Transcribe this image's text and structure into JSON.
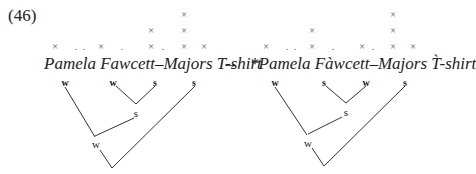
{
  "example": {
    "number": "(46)",
    "arrow": "→",
    "mark": "×",
    "dot": ".",
    "left": {
      "phrase": "Pamela Fawcett–Majors T-shirt",
      "grid_columns": [
        {
          "x": 55,
          "rows": [
            "×"
          ]
        },
        {
          "x": 76,
          "rows": [
            "."
          ]
        },
        {
          "x": 84,
          "rows": [
            "."
          ]
        },
        {
          "x": 101,
          "rows": [
            "×"
          ]
        },
        {
          "x": 122,
          "rows": [
            "."
          ]
        },
        {
          "x": 151,
          "rows": [
            "×",
            "×"
          ]
        },
        {
          "x": 163,
          "rows": [
            "."
          ]
        },
        {
          "x": 184,
          "rows": [
            "×",
            "×",
            "×"
          ]
        },
        {
          "x": 204,
          "rows": [
            "×"
          ]
        }
      ],
      "leaf_labels": [
        "w",
        "w",
        "s",
        "s"
      ],
      "inner_labels": [
        "s",
        "w"
      ]
    },
    "right": {
      "phrase": "*Pamela Fàwcett–Majors T̀-shirt",
      "grid_columns": [
        {
          "x": 266,
          "rows": [
            "×"
          ]
        },
        {
          "x": 287,
          "rows": [
            "."
          ]
        },
        {
          "x": 295,
          "rows": [
            "."
          ]
        },
        {
          "x": 312,
          "rows": [
            "×",
            "×"
          ]
        },
        {
          "x": 333,
          "rows": [
            "."
          ]
        },
        {
          "x": 362,
          "rows": [
            "×"
          ]
        },
        {
          "x": 373,
          "rows": [
            "."
          ]
        },
        {
          "x": 393,
          "rows": [
            "×",
            "×",
            "×"
          ]
        },
        {
          "x": 413,
          "rows": [
            "×"
          ]
        }
      ],
      "leaf_labels": [
        "w",
        "s",
        "w",
        "s"
      ],
      "inner_labels": [
        "s",
        "w"
      ]
    }
  }
}
